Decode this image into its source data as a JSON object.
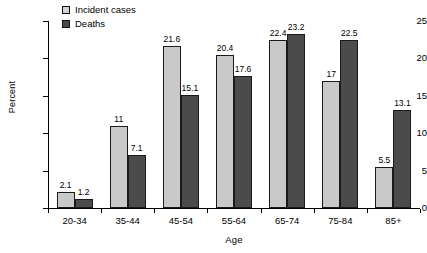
{
  "chart_data": {
    "type": "bar",
    "title": "",
    "subtitle": "",
    "xlabel": "Age",
    "ylabel": "Percent",
    "categories": [
      "20-34",
      "35-44",
      "45-54",
      "55-64",
      "65-74",
      "75-84",
      "85+"
    ],
    "series": [
      {
        "name": "Incident cases",
        "color": "#c9c9c9",
        "values": [
          2.1,
          11,
          21.6,
          20.4,
          22.4,
          17,
          5.5
        ],
        "labels": [
          "2.1",
          "11",
          "21.6",
          "20.4",
          "22.4",
          "17",
          "5.5"
        ]
      },
      {
        "name": "Deaths",
        "color": "#4b4b4b",
        "values": [
          1.2,
          7.1,
          15.1,
          17.6,
          23.2,
          22.5,
          13.1
        ],
        "labels": [
          "1.2",
          "7.1",
          "15.1",
          "17.6",
          "23.2",
          "22.5",
          "13.1"
        ]
      }
    ],
    "ylim": [
      0,
      25
    ],
    "yticks": [
      0,
      5,
      10,
      15,
      20,
      25
    ],
    "ytick_labels": [
      "0",
      "5",
      "10",
      "15",
      "20",
      "25"
    ],
    "grid": false,
    "legend_position": "top-left"
  },
  "legend": {
    "items": [
      {
        "label": "Incident cases",
        "swatch": "legend-swatch-incident-cases"
      },
      {
        "label": "Deaths",
        "swatch": "legend-swatch-deaths"
      }
    ]
  }
}
